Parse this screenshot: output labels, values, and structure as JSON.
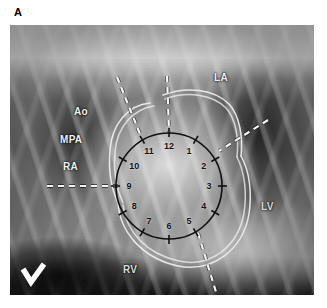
{
  "figure": {
    "panel_label": "A",
    "modality": "lateral thoracic radiograph",
    "position_marker": "L",
    "position_marker_icon": "left-marker-icon"
  },
  "anatomical_labels": [
    {
      "id": "ao",
      "text": "Ao",
      "name": "aorta",
      "x": 74,
      "y": 106,
      "color": "#f2f2f2"
    },
    {
      "id": "mpa",
      "text": "MPA",
      "name": "main-pulmonary-artery",
      "x": 60,
      "y": 134,
      "color": "#f2f2f2"
    },
    {
      "id": "ra",
      "text": "RA",
      "name": "right-atrium",
      "x": 63,
      "y": 161,
      "color": "#f2f2f2"
    },
    {
      "id": "la",
      "text": "LA",
      "name": "left-atrium",
      "x": 214,
      "y": 72,
      "color": "#f2f2f2"
    },
    {
      "id": "lv",
      "text": "LV",
      "name": "left-ventricle",
      "x": 261,
      "y": 201,
      "color": "#dcdcdc"
    },
    {
      "id": "rv",
      "text": "RV",
      "name": "right-ventricle",
      "x": 123,
      "y": 264,
      "color": "#dcdcdc"
    }
  ],
  "clock_overlay": {
    "center_x": 169,
    "center_y": 186,
    "radius": 53,
    "stroke_color": "#101010",
    "stroke_width": 1.6,
    "tick_length": 9,
    "label_radius": 40,
    "hours": [
      {
        "hour": "12",
        "angle_deg": 0
      },
      {
        "hour": "1",
        "angle_deg": 30
      },
      {
        "hour": "2",
        "angle_deg": 60
      },
      {
        "hour": "3",
        "angle_deg": 90
      },
      {
        "hour": "4",
        "angle_deg": 120
      },
      {
        "hour": "5",
        "angle_deg": 150
      },
      {
        "hour": "6",
        "angle_deg": 180
      },
      {
        "hour": "7",
        "angle_deg": 210
      },
      {
        "hour": "8",
        "angle_deg": 240
      },
      {
        "hour": "9",
        "angle_deg": 270
      },
      {
        "hour": "10",
        "angle_deg": 300
      },
      {
        "hour": "11",
        "angle_deg": 330
      }
    ]
  },
  "dashed_axes": {
    "color": "#f5f5f5",
    "width": 2.2,
    "dash": "6 5",
    "lines": [
      {
        "id": "axis-horizontal-left",
        "name": "nine-oclock-axis",
        "x1": 47,
        "y1": 186,
        "x2": 118,
        "y2": 186
      },
      {
        "id": "axis-oblique-upper",
        "name": "eleven-oclock-axis",
        "x1": 117,
        "y1": 77,
        "x2": 140,
        "y2": 134
      },
      {
        "id": "axis-vertical-top",
        "name": "twelve-oclock-axis",
        "x1": 167,
        "y1": 76,
        "x2": 169,
        "y2": 132
      },
      {
        "id": "axis-oblique-right",
        "name": "two-oclock-axis",
        "x1": 268,
        "y1": 120,
        "x2": 219,
        "y2": 151
      },
      {
        "id": "axis-oblique-lower",
        "name": "five-oclock-axis",
        "x1": 198,
        "y1": 233,
        "x2": 216,
        "y2": 292
      }
    ]
  },
  "cardiac_silhouette": {
    "color": "#ededed",
    "width": 1.5,
    "description": "traced heart border outlines"
  }
}
